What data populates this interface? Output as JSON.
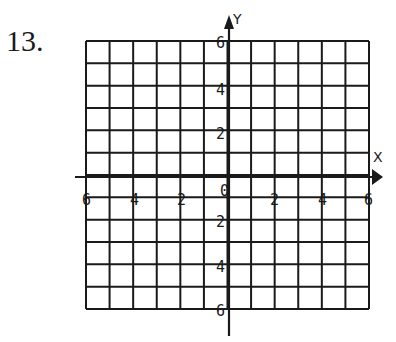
{
  "problem": {
    "number": "13."
  },
  "grid": {
    "left": 86,
    "right": 369,
    "top": 41,
    "bottom": 309,
    "columns": 12,
    "rows": 12,
    "line_color": "#1a1a1a"
  },
  "axes": {
    "x_label": "X",
    "y_label": "Y",
    "x_ticks": [
      "6",
      "4",
      "2",
      "0",
      "2",
      "4",
      "6"
    ],
    "y_ticks_upper": [
      "6",
      "4",
      "2"
    ],
    "y_ticks_lower": [
      "2",
      "4",
      "6"
    ]
  }
}
